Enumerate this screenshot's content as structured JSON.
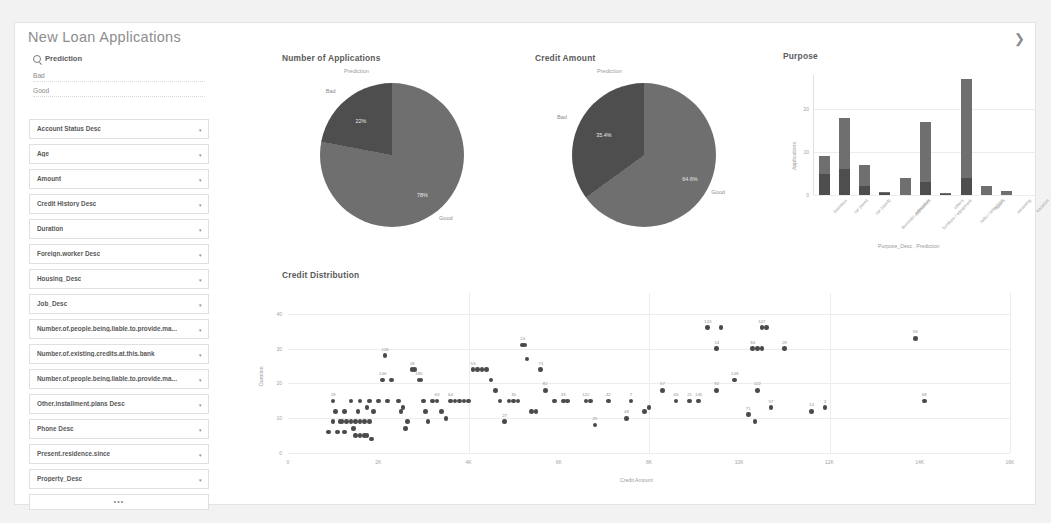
{
  "app": {
    "title": "New Loan Applications",
    "expand_icon": "chevron-right-icon"
  },
  "sidebar": {
    "filter_header": "Prediction",
    "search_icon": "search-icon",
    "filter_options": [
      "Bad",
      "Good"
    ],
    "fields": [
      "Account Status Desc",
      "Age",
      "Amount",
      "Credit History Desc",
      "Duration",
      "Foreign.worker Desc",
      "Housing_Desc",
      "Job_Desc",
      "Number.of.people.being.liable.to.provide.ma...",
      "Number.of.existing.credits.at.this.bank",
      "Number.of.people.being.liable.to.provide.ma...",
      "Other.installment.plans Desc",
      "Phone Desc",
      "Present.residence.since",
      "Property_Desc"
    ],
    "more_label": "•••",
    "caret_icon": "chevron-down-icon"
  },
  "panels": {
    "applications_title": "Number of Applications",
    "credit_amount_title": "Credit Amount",
    "purpose_title": "Purpose",
    "credit_distribution_title": "Credit Distribution"
  },
  "colors": {
    "bad": "#4e4e4e",
    "good": "#6f6f6f",
    "dot": "#4a4a4a",
    "grid": "#ececec",
    "text": "#8a8a8a"
  },
  "chart_data": [
    {
      "type": "pie",
      "title": "Number of Applications",
      "legend_title": "Prediction",
      "labels": [
        "Bad",
        "Good"
      ],
      "values": [
        22,
        78
      ],
      "value_labels": [
        "22%",
        "78%"
      ],
      "legend_position": "on-slice"
    },
    {
      "type": "pie",
      "title": "Credit Amount",
      "legend_title": "Prediction",
      "labels": [
        "Bad",
        "Good"
      ],
      "values": [
        35,
        65
      ],
      "value_labels": [
        "35.4%",
        "64.6%"
      ],
      "legend_position": "on-slice"
    },
    {
      "type": "bar",
      "title": "Purpose",
      "stacked": true,
      "categories": [
        "business",
        "car (new)",
        "car (used)",
        "domestic appliances",
        "education",
        "furniture / equipment",
        "others",
        "radio / television",
        "repairs",
        "retraining",
        "vacation"
      ],
      "series": [
        {
          "name": "Bad",
          "values": [
            5,
            6,
            2,
            0.5,
            0,
            3,
            0.3,
            4,
            0,
            0,
            0
          ]
        },
        {
          "name": "Good",
          "values": [
            4,
            12,
            5,
            0.3,
            4,
            14,
            0.2,
            23,
            2,
            1,
            0
          ]
        }
      ],
      "xlabel": "Purpose_Desc , Prediction",
      "ylabel": "Applications",
      "yticks": [
        0,
        10,
        20
      ],
      "ylim": [
        0,
        28
      ],
      "grid": true
    },
    {
      "type": "scatter",
      "title": "Credit Distribution",
      "xlabel": "Credit Amount",
      "ylabel": "Duration",
      "xticks": [
        "0",
        "2K",
        "4K",
        "6K",
        "8K",
        "10K",
        "12K",
        "14K",
        "16K"
      ],
      "xlim": [
        0,
        16000
      ],
      "yticks": [
        0,
        10,
        20,
        30,
        40
      ],
      "ylim": [
        0,
        46
      ],
      "grid": true,
      "points": [
        {
          "x": 900,
          "y": 6
        },
        {
          "x": 1100,
          "y": 6
        },
        {
          "x": 1250,
          "y": 6
        },
        {
          "x": 1450,
          "y": 7
        },
        {
          "x": 1500,
          "y": 5
        },
        {
          "x": 1600,
          "y": 5
        },
        {
          "x": 1700,
          "y": 5
        },
        {
          "x": 1750,
          "y": 5
        },
        {
          "x": 1850,
          "y": 4
        },
        {
          "x": 1000,
          "y": 9
        },
        {
          "x": 1150,
          "y": 9
        },
        {
          "x": 1200,
          "y": 9
        },
        {
          "x": 1300,
          "y": 9
        },
        {
          "x": 1400,
          "y": 9
        },
        {
          "x": 1500,
          "y": 9
        },
        {
          "x": 1600,
          "y": 9
        },
        {
          "x": 1700,
          "y": 9
        },
        {
          "x": 1800,
          "y": 9
        },
        {
          "x": 1050,
          "y": 12
        },
        {
          "x": 1250,
          "y": 12
        },
        {
          "x": 1550,
          "y": 12
        },
        {
          "x": 1750,
          "y": 13
        },
        {
          "x": 1900,
          "y": 12
        },
        {
          "x": 1000,
          "y": 15,
          "label": "19"
        },
        {
          "x": 1400,
          "y": 15
        },
        {
          "x": 1600,
          "y": 15
        },
        {
          "x": 1800,
          "y": 15
        },
        {
          "x": 2000,
          "y": 15
        },
        {
          "x": 2200,
          "y": 15
        },
        {
          "x": 2100,
          "y": 21,
          "label": "146"
        },
        {
          "x": 2300,
          "y": 21
        },
        {
          "x": 2150,
          "y": 28,
          "label": "118"
        },
        {
          "x": 2450,
          "y": 15
        },
        {
          "x": 2500,
          "y": 12
        },
        {
          "x": 2550,
          "y": 13
        },
        {
          "x": 2600,
          "y": 7
        },
        {
          "x": 2650,
          "y": 9
        },
        {
          "x": 2750,
          "y": 24,
          "label": "18"
        },
        {
          "x": 2800,
          "y": 24
        },
        {
          "x": 2900,
          "y": 21,
          "label": "185"
        },
        {
          "x": 2950,
          "y": 21
        },
        {
          "x": 3000,
          "y": 15
        },
        {
          "x": 3050,
          "y": 12
        },
        {
          "x": 3100,
          "y": 9
        },
        {
          "x": 3200,
          "y": 15
        },
        {
          "x": 3300,
          "y": 15,
          "label": "63"
        },
        {
          "x": 3400,
          "y": 12
        },
        {
          "x": 3500,
          "y": 10
        },
        {
          "x": 3600,
          "y": 15,
          "label": "64"
        },
        {
          "x": 3700,
          "y": 15
        },
        {
          "x": 3800,
          "y": 15
        },
        {
          "x": 3900,
          "y": 15
        },
        {
          "x": 4000,
          "y": 15
        },
        {
          "x": 4100,
          "y": 24,
          "label": "53"
        },
        {
          "x": 4200,
          "y": 24
        },
        {
          "x": 4300,
          "y": 24
        },
        {
          "x": 4400,
          "y": 24
        },
        {
          "x": 4500,
          "y": 21
        },
        {
          "x": 4600,
          "y": 18
        },
        {
          "x": 4700,
          "y": 15
        },
        {
          "x": 4800,
          "y": 9,
          "label": "27"
        },
        {
          "x": 4900,
          "y": 15
        },
        {
          "x": 5000,
          "y": 15,
          "label": "30"
        },
        {
          "x": 5100,
          "y": 15
        },
        {
          "x": 5200,
          "y": 31,
          "label": "24"
        },
        {
          "x": 5250,
          "y": 31
        },
        {
          "x": 5300,
          "y": 27
        },
        {
          "x": 5400,
          "y": 12
        },
        {
          "x": 5500,
          "y": 12
        },
        {
          "x": 5600,
          "y": 24,
          "label": "73"
        },
        {
          "x": 5700,
          "y": 18,
          "label": "82"
        },
        {
          "x": 5900,
          "y": 15
        },
        {
          "x": 6100,
          "y": 15,
          "label": "33"
        },
        {
          "x": 6200,
          "y": 15
        },
        {
          "x": 6600,
          "y": 15,
          "label": "122"
        },
        {
          "x": 6700,
          "y": 15
        },
        {
          "x": 6800,
          "y": 8,
          "label": "25"
        },
        {
          "x": 7100,
          "y": 15,
          "label": "42"
        },
        {
          "x": 7500,
          "y": 10,
          "label": "48"
        },
        {
          "x": 7900,
          "y": 12
        },
        {
          "x": 8000,
          "y": 13
        },
        {
          "x": 8300,
          "y": 18,
          "label": "57"
        },
        {
          "x": 8600,
          "y": 15,
          "label": "65"
        },
        {
          "x": 8900,
          "y": 15,
          "label": "21"
        },
        {
          "x": 9100,
          "y": 15,
          "label": "145"
        },
        {
          "x": 9500,
          "y": 18,
          "label": "92"
        },
        {
          "x": 9300,
          "y": 36,
          "label": "143"
        },
        {
          "x": 9600,
          "y": 36
        },
        {
          "x": 9500,
          "y": 30,
          "label": "14"
        },
        {
          "x": 9900,
          "y": 21,
          "label": "148"
        },
        {
          "x": 10400,
          "y": 18,
          "label": "122"
        },
        {
          "x": 10500,
          "y": 36,
          "label": "147"
        },
        {
          "x": 10600,
          "y": 36
        },
        {
          "x": 10300,
          "y": 30,
          "label": "84"
        },
        {
          "x": 10400,
          "y": 30
        },
        {
          "x": 10500,
          "y": 30
        },
        {
          "x": 11000,
          "y": 30,
          "label": "29"
        },
        {
          "x": 10200,
          "y": 11,
          "label": "71"
        },
        {
          "x": 10350,
          "y": 9
        },
        {
          "x": 10700,
          "y": 13,
          "label": "57"
        },
        {
          "x": 11900,
          "y": 13,
          "label": "3"
        },
        {
          "x": 11600,
          "y": 12,
          "label": "14"
        },
        {
          "x": 13900,
          "y": 33,
          "label": "58"
        },
        {
          "x": 14100,
          "y": 15,
          "label": "68"
        },
        {
          "x": 7600,
          "y": 15,
          "label": "7"
        }
      ]
    }
  ]
}
